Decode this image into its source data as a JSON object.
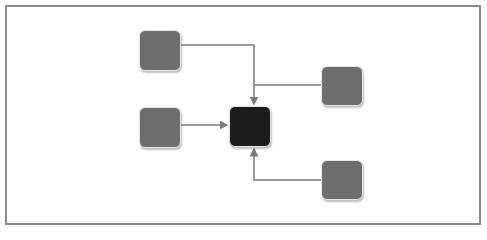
{
  "diagram": {
    "frame": {
      "border_color": "#8c8c8c"
    },
    "colors": {
      "node": "#6e6e6e",
      "center": "#1c1c1c",
      "edge": "#7a7a7a"
    },
    "nodes": [
      {
        "id": "top-left",
        "x": 139,
        "y": 30,
        "w": 42,
        "h": 41,
        "color": "#6e6e6e"
      },
      {
        "id": "mid-left",
        "x": 139,
        "y": 107,
        "w": 42,
        "h": 41,
        "color": "#6e6e6e"
      },
      {
        "id": "center",
        "x": 229,
        "y": 106,
        "w": 42,
        "h": 41,
        "color": "#1c1c1c"
      },
      {
        "id": "top-right",
        "x": 321,
        "y": 66,
        "w": 42,
        "h": 40,
        "color": "#6e6e6e"
      },
      {
        "id": "bottom-right",
        "x": 321,
        "y": 160,
        "w": 42,
        "h": 40,
        "color": "#6e6e6e"
      }
    ],
    "edges": [
      {
        "from": "top-left",
        "to": "center",
        "path": "M181 45 H254 V104"
      },
      {
        "from": "top-right",
        "to": "center",
        "path": "M321 85 H254"
      },
      {
        "from": "mid-left",
        "to": "center",
        "path": "M181 125 H227"
      },
      {
        "from": "bottom-right",
        "to": "center",
        "path": "M321 180 H254 V149"
      }
    ]
  }
}
